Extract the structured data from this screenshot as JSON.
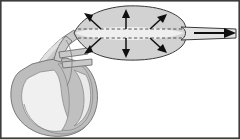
{
  "figure": {
    "title": "Intra-aortic balloon catheter inflation diagram",
    "caption": "",
    "background_color": "#ffffff",
    "width": 240,
    "height": 139
  },
  "palette": {
    "balloon_fill": "#d2d2d2",
    "balloon_lumen_fill": "#efefef",
    "balloon_outline": "#3a3a3a",
    "heart_fill": "#bdbdbd",
    "heart_chamber_fill": "#f2f2f2",
    "vessel_fill": "#c9c9c9",
    "vessel_light_fill": "#e6e6e6",
    "outline_gray": "#6e6e6e",
    "arrow_color": "#101010",
    "dash_color": "#2b2b2b",
    "frame_color": "#3c3c3c"
  },
  "parts": {
    "heart": {
      "label": "heart",
      "description": "Cross-sectional heart with chambers and great vessels at lower left"
    },
    "aorta": {
      "label": "aorta",
      "description": "Ascending aorta and arch curving up and right toward the balloon"
    },
    "balloon": {
      "label": "inflated balloon",
      "description": "Elongated fusiform balloon inflated within the vessel lumen"
    },
    "catheter_shaft": {
      "label": "catheter shaft",
      "description": "Tapered shaft exiting the balloon tip to the right"
    },
    "lumen_dashes": {
      "label": "deflated balloon outline",
      "count": 2,
      "description": "Dashed lines marking the uninflated balloon profile"
    }
  },
  "annotations": {
    "expansion_arrows": {
      "label": "radial expansion arrows",
      "count": 6,
      "meaning": "balloon expands outward against the vessel wall",
      "items": [
        {
          "id": "arrow-upper-left",
          "direction": "up-left",
          "x1": 101,
          "y1": 29,
          "x2": 85,
          "y2": 14
        },
        {
          "id": "arrow-upper-center",
          "direction": "up",
          "x1": 126,
          "y1": 29,
          "x2": 126,
          "y2": 11
        },
        {
          "id": "arrow-upper-right",
          "direction": "up-right",
          "x1": 150,
          "y1": 29,
          "x2": 165,
          "y2": 15
        },
        {
          "id": "arrow-lower-left",
          "direction": "down-left",
          "x1": 101,
          "y1": 38,
          "x2": 85,
          "y2": 53
        },
        {
          "id": "arrow-lower-center",
          "direction": "down",
          "x1": 126,
          "y1": 38,
          "x2": 126,
          "y2": 56
        },
        {
          "id": "arrow-lower-right",
          "direction": "down-right",
          "x1": 150,
          "y1": 38,
          "x2": 165,
          "y2": 52
        }
      ]
    },
    "flow_arrow": {
      "label": "catheter direction arrow",
      "direction": "right",
      "meaning": "catheter shaft exits toward the insertion site",
      "x1": 196,
      "y1": 33,
      "x2": 232,
      "y2": 33
    }
  }
}
